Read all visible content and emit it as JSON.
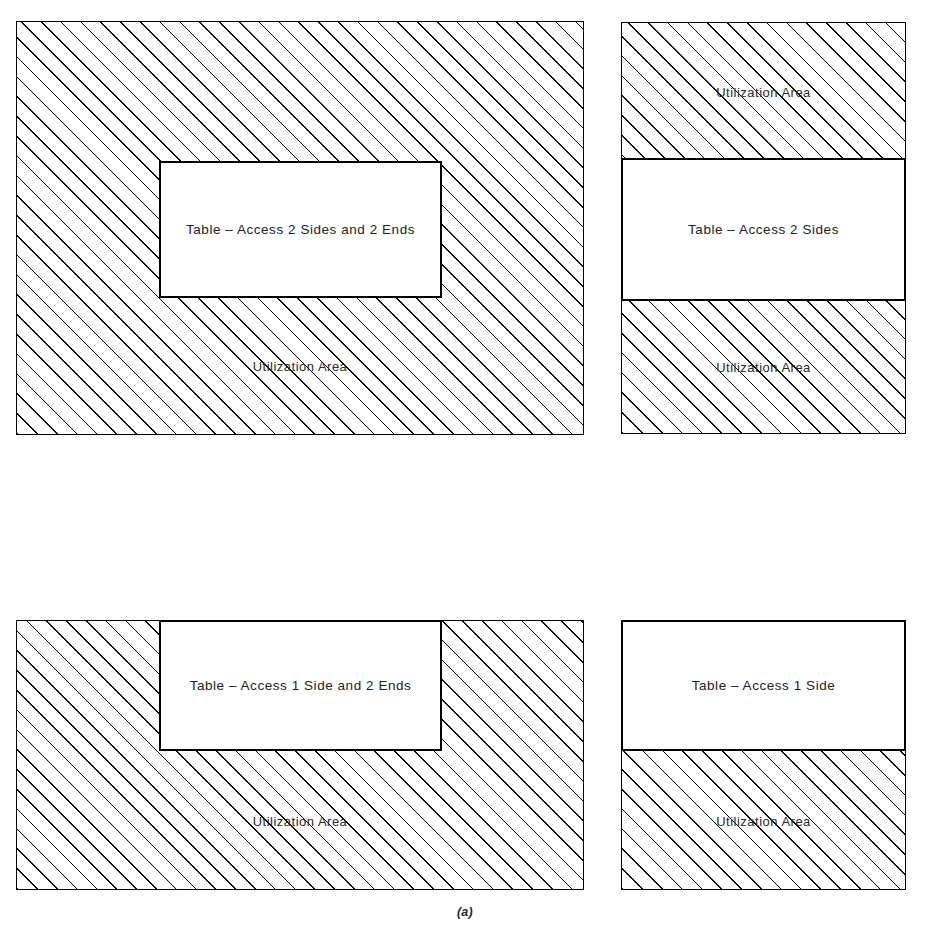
{
  "figure": {
    "caption": "(a)",
    "utilization_area_label": "Utilization Area"
  },
  "panels": [
    {
      "id": "panel-a",
      "position": "top-left",
      "table_label": "Table – Access 2 Sides and 2 Ends",
      "utilization_labels": [
        "Utilization Area"
      ],
      "access_sides": 2,
      "access_ends": 2,
      "table_touches_edges": []
    },
    {
      "id": "panel-b",
      "position": "top-right",
      "table_label": "Table – Access 2 Sides",
      "utilization_labels": [
        "Utilization Area",
        "Utilization Area"
      ],
      "access_sides": 2,
      "access_ends": 0,
      "table_touches_edges": [
        "left",
        "right"
      ]
    },
    {
      "id": "panel-c",
      "position": "bottom-left",
      "table_label": "Table – Access 1 Side and 2 Ends",
      "utilization_labels": [
        "Utilization Area"
      ],
      "access_sides": 1,
      "access_ends": 2,
      "table_touches_edges": [
        "top"
      ]
    },
    {
      "id": "panel-d",
      "position": "bottom-right",
      "table_label": "Table – Access 1 Side",
      "utilization_labels": [
        "Utilization Area"
      ],
      "access_sides": 1,
      "access_ends": 0,
      "table_touches_edges": [
        "top",
        "left",
        "right"
      ]
    }
  ],
  "style": {
    "hatch_color": "#000000",
    "hatch_angle_deg": 45,
    "hatch_spacing_px": 14,
    "table_fill": "#ffffff",
    "border_color": "#000000",
    "background": "#ffffff"
  }
}
